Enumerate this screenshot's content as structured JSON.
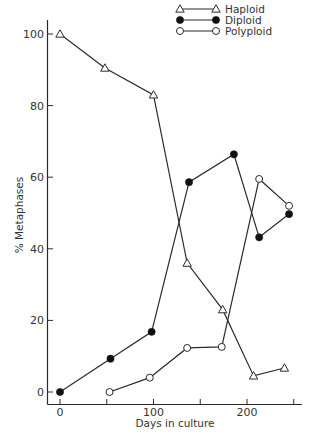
{
  "chart_data": {
    "type": "line",
    "title": "",
    "xlabel": "Days in culture",
    "ylabel": "% Metaphases",
    "xlim": [
      -15,
      260
    ],
    "ylim": [
      -3,
      105
    ],
    "xticks": [
      0,
      50,
      100,
      150,
      200,
      250
    ],
    "xtick_labels": [
      "0",
      "",
      "100",
      "",
      "200",
      ""
    ],
    "yticks": [
      0,
      20,
      40,
      60,
      80,
      100
    ],
    "ytick_labels": [
      "0",
      "20",
      "40",
      "60",
      "80",
      "100"
    ],
    "grid": false,
    "legend_position": "top-right",
    "series": [
      {
        "name": "Haploid",
        "marker": "open-triangle",
        "x": [
          0,
          48,
          100,
          136,
          174,
          207,
          240
        ],
        "y": [
          100,
          90.5,
          83,
          36,
          23,
          4.5,
          6.7
        ]
      },
      {
        "name": "Diploid",
        "marker": "filled-circle",
        "x": [
          0,
          54,
          98,
          138,
          186,
          213,
          245
        ],
        "y": [
          0,
          9.3,
          16.8,
          58.6,
          66.4,
          43.2,
          49.7
        ]
      },
      {
        "name": "Polyploid",
        "marker": "open-circle",
        "x": [
          53,
          96,
          136,
          173,
          213,
          245
        ],
        "y": [
          0,
          4,
          12.3,
          12.6,
          59.5,
          52
        ]
      }
    ]
  }
}
